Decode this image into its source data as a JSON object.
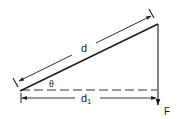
{
  "diagram": {
    "colors": {
      "line": "#1a1a1a",
      "background": "#ffffff"
    },
    "labels": {
      "hypotenuse_length": "d",
      "horizontal_length": "d",
      "horizontal_subscript": "1",
      "angle": "θ",
      "force": "F"
    },
    "elements": [
      {
        "id": "hypotenuse",
        "type": "solid-line",
        "from": [
          20,
          91
        ],
        "to": [
          158,
          24
        ]
      },
      {
        "id": "vertical-force-line",
        "type": "solid-line-arrow",
        "from": [
          158,
          24
        ],
        "to": [
          158,
          106
        ],
        "label": "F"
      },
      {
        "id": "horizontal-reference",
        "type": "dashed-line",
        "from": [
          20,
          90
        ],
        "to": [
          157,
          90
        ]
      },
      {
        "id": "d-dimension",
        "type": "double-arrow",
        "from": [
          18,
          82
        ],
        "to": [
          152,
          15
        ],
        "label": "d"
      },
      {
        "id": "d1-dimension",
        "type": "double-arrow",
        "from": [
          22,
          98
        ],
        "to": [
          156,
          98
        ],
        "label": "d1"
      },
      {
        "id": "theta-angle",
        "type": "angle-label",
        "at": [
          52,
          84
        ],
        "label": "θ"
      }
    ]
  }
}
